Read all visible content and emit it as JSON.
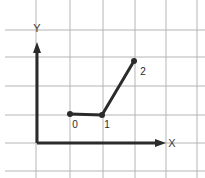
{
  "figure": {
    "title": "",
    "background_color": "#ffffff",
    "width": 205,
    "height": 178
  },
  "grid": {
    "color": "#b5b5b5",
    "line_width": 1,
    "vertical_lines_x": [
      36,
      70,
      103,
      135,
      166,
      197
    ],
    "horizontal_lines_y": [
      30,
      57,
      86,
      115,
      143,
      171
    ],
    "spacing_x": 32,
    "spacing_y": 28
  },
  "axes": {
    "color": "#2b2b2b",
    "line_width": 3,
    "origin": {
      "x": 37,
      "y": 143
    },
    "x_axis": {
      "label": "X",
      "label_x": 172,
      "label_y": 147,
      "from_x": 37,
      "to_x": 166,
      "y": 143,
      "arrow": "right-arrow"
    },
    "y_axis": {
      "label": "Y",
      "label_x": 37,
      "label_y": 32,
      "from_y": 143,
      "to_y": 42,
      "x": 37,
      "arrow": "up-arrow"
    }
  },
  "chart_data": {
    "type": "line",
    "title": "",
    "xlabel": "X",
    "ylabel": "Y",
    "grid": true,
    "legend": false,
    "series": [
      {
        "name": "path",
        "color": "#2b2b2b",
        "line_width": 3,
        "marker": "filled-circle",
        "marker_radius": 3,
        "points": [
          {
            "label": "0",
            "px": 70,
            "py": 114,
            "label_px": 75,
            "label_py": 128
          },
          {
            "label": "1",
            "px": 102,
            "py": 115,
            "label_px": 107,
            "label_py": 128
          },
          {
            "label": "2",
            "px": 134,
            "py": 61,
            "label_px": 143,
            "label_py": 75
          }
        ]
      }
    ]
  }
}
